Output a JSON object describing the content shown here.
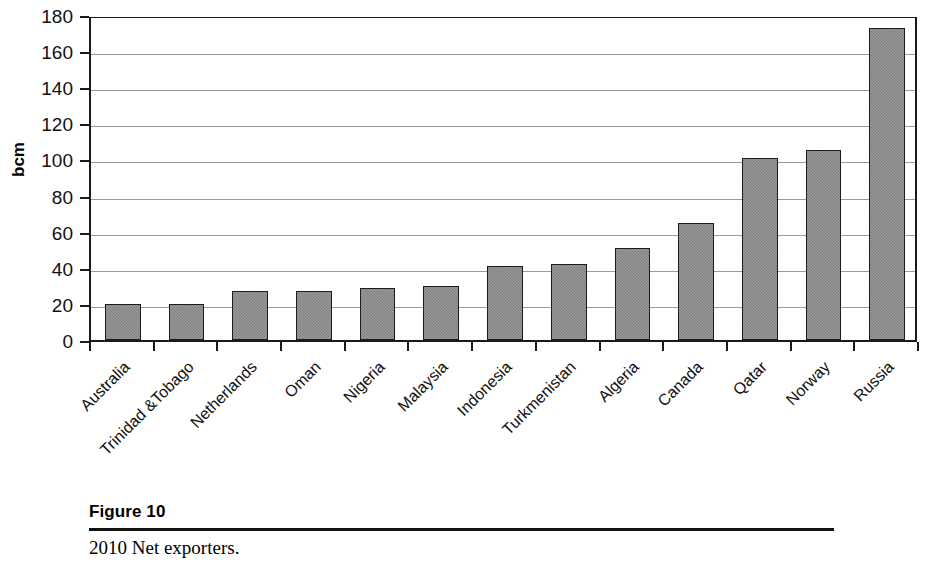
{
  "figure": {
    "number_label": "Figure 10",
    "caption": "2010 Net exporters."
  },
  "chart_data": {
    "type": "bar",
    "title": "",
    "xlabel": "",
    "ylabel": "bcm",
    "ylim": [
      0,
      180
    ],
    "ytick_step": 20,
    "yticks": [
      "180",
      "160",
      "140",
      "120",
      "100",
      "80",
      "60",
      "40",
      "20",
      "0"
    ],
    "grid": true,
    "legend": "none",
    "bar_color": "#7f7f7f",
    "bar_border_color": "#1c1c1c",
    "categories": [
      "Australia",
      "Trinidad &Tobago",
      "Netherlands",
      "Oman",
      "Nigeria",
      "Malaysia",
      "Indonesia",
      "Turkmenistan",
      "Algeria",
      "Canada",
      "Qatar",
      "Norway",
      "Russia"
    ],
    "values": [
      20,
      20,
      27,
      27,
      29,
      30,
      41,
      42,
      51,
      65,
      101,
      105,
      173
    ]
  }
}
